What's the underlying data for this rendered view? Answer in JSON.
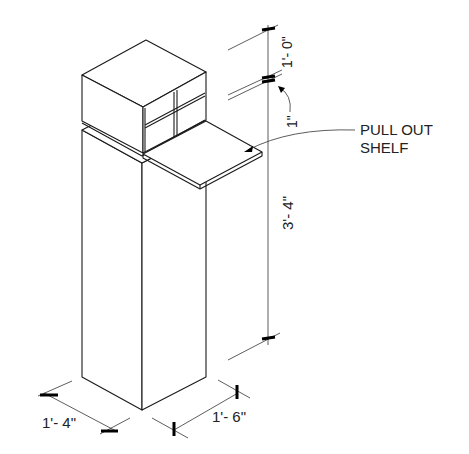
{
  "drawing": {
    "type": "isometric kiosk with pull out shelf",
    "colors": {
      "line": "#1a1a1a",
      "background": "#ffffff"
    }
  },
  "labels": {
    "callout_line1": "PULL OUT",
    "callout_line2": "SHELF"
  },
  "dimensions": {
    "top_box_height": "1'- 0\"",
    "gap": "1\"",
    "base_height": "3'- 4\"",
    "depth": "1'- 4\"",
    "width": "1'- 6\""
  }
}
